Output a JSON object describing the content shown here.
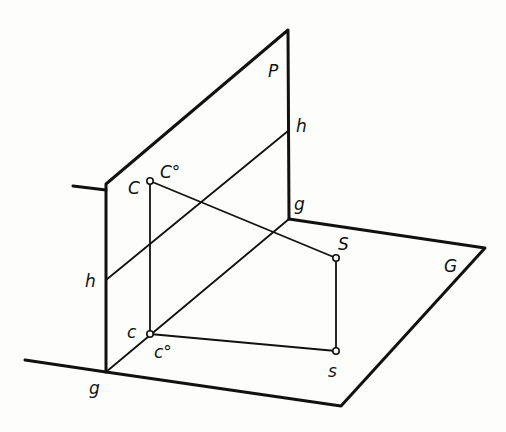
{
  "diagram": {
    "planes": [
      {
        "name": "P",
        "label": "P",
        "type": "vertical projection plane"
      },
      {
        "name": "G",
        "label": "G",
        "type": "horizontal ground plane"
      }
    ],
    "lines": {
      "ground_trace": "g",
      "ground_trace_top": "g",
      "horizontal_trace_left": "h",
      "horizontal_trace_right": "h"
    },
    "points": {
      "C": {
        "label": "C",
        "superscript_label": "C°"
      },
      "c": {
        "label": "c",
        "superscript_label": "c°"
      },
      "S": {
        "label": "S"
      },
      "s": {
        "label": "s"
      }
    },
    "labels": {
      "P": "P",
      "G": "G",
      "h_top": "h",
      "h_left": "h",
      "g_top": "g",
      "g_bottom": "g",
      "C": "C",
      "C_deg": "C°",
      "c": "c",
      "c_deg": "c°",
      "S": "S",
      "s": "s"
    },
    "colors": {
      "line": "#111111",
      "background": "#fdfdfb"
    }
  }
}
